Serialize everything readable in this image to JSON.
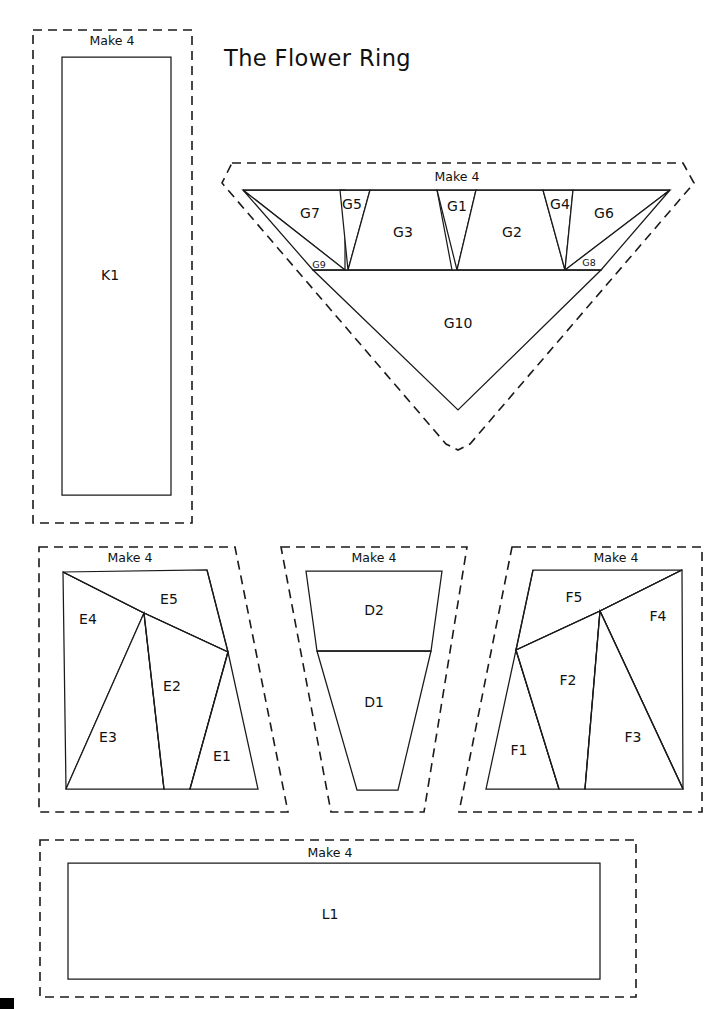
{
  "document": {
    "title": "The Flower Ring",
    "title_position": {
      "x": 224,
      "y": 66
    },
    "page_width": 726,
    "page_height": 1009,
    "background_color": "#ffffff",
    "line_color": "#1a1a1a",
    "corner_mark": {
      "x": 0,
      "y": 998,
      "width": 14,
      "height": 11
    }
  },
  "blocks": [
    {
      "id": "block-k",
      "name": "K",
      "make_label": "Make 4",
      "make_label_position": {
        "x": 112,
        "y": 45
      },
      "cut_outline": "M 33 30 L 192 30 L 192 523 L 33 523 Z",
      "pieces": [
        {
          "id": "K1",
          "label": "K1",
          "label_position": {
            "x": 110,
            "y": 276
          },
          "label_size": "normal",
          "shape": "M 62 57 L 171 57 L 171 495 L 62 495 Z"
        }
      ],
      "seams": []
    },
    {
      "id": "block-g",
      "name": "G",
      "make_label": "Make 4",
      "make_label_position": {
        "x": 457,
        "y": 181
      },
      "cut_outline": "M 232 163 L 683 163 L 694 183 L 470 444 L 458 450 L 446 444 L 222 183 Z",
      "pieces": [
        {
          "id": "G7",
          "label": "G7",
          "label_position": {
            "x": 310,
            "y": 214
          },
          "label_size": "normal",
          "shape": "M 243 190 L 345 190 L 345 270 Z"
        },
        {
          "id": "G9",
          "label": "G9",
          "label_position": {
            "x": 319,
            "y": 265
          },
          "label_size": "small",
          "shape": "M 243 190 L 345 270 L 313 270 Z"
        },
        {
          "id": "G5",
          "label": "G5",
          "label_position": {
            "x": 352,
            "y": 205
          },
          "label_size": "normal",
          "shape": "M 340 190 L 370 190 L 348 270 Z"
        },
        {
          "id": "G3",
          "label": "G3",
          "label_position": {
            "x": 403,
            "y": 233
          },
          "label_size": "normal",
          "shape": "M 370 190 L 437 190 L 452 270 L 348 270 Z"
        },
        {
          "id": "G1",
          "label": "G1",
          "label_position": {
            "x": 457,
            "y": 207
          },
          "label_size": "normal",
          "shape": "M 437 190 L 476 190 L 457 270 Z"
        },
        {
          "id": "G2",
          "label": "G2",
          "label_position": {
            "x": 512,
            "y": 233
          },
          "label_size": "normal",
          "shape": "M 476 190 L 543 190 L 565 270 L 457 270 Z"
        },
        {
          "id": "G4",
          "label": "G4",
          "label_position": {
            "x": 560,
            "y": 205
          },
          "label_size": "normal",
          "shape": "M 543 190 L 573 190 L 565 270 Z"
        },
        {
          "id": "G6",
          "label": "G6",
          "label_position": {
            "x": 604,
            "y": 214
          },
          "label_size": "normal",
          "shape": "M 573 190 L 670 190 L 565 270 Z"
        },
        {
          "id": "G8",
          "label": "G8",
          "label_position": {
            "x": 589,
            "y": 263
          },
          "label_size": "small",
          "shape": "M 670 190 L 601 270 L 565 270 Z"
        },
        {
          "id": "G10",
          "label": "G10",
          "label_position": {
            "x": 458,
            "y": 324
          },
          "label_size": "normal",
          "shape": "M 313 270 L 601 270 L 458 410 Z"
        }
      ],
      "seams": [
        "M 243 190 L 670 190",
        "M 313 270 L 601 270"
      ]
    },
    {
      "id": "block-e",
      "name": "E",
      "make_label": "Make 4",
      "make_label_position": {
        "x": 130,
        "y": 562
      },
      "cut_outline": "M 39 547 L 235 547 L 288 812 L 39 812 Z",
      "pieces": [
        {
          "id": "E4",
          "label": "E4",
          "label_position": {
            "x": 88,
            "y": 620
          },
          "label_size": "normal",
          "shape": "M 63 572 L 144 613 L 66 789 Z"
        },
        {
          "id": "E5",
          "label": "E5",
          "label_position": {
            "x": 169,
            "y": 600
          },
          "label_size": "normal",
          "shape": "M 63 572 L 207 570 L 228 652 L 144 613 Z"
        },
        {
          "id": "E3",
          "label": "E3",
          "label_position": {
            "x": 108,
            "y": 738
          },
          "label_size": "normal",
          "shape": "M 144 613 L 164 789 L 66 789 Z"
        },
        {
          "id": "E2",
          "label": "E2",
          "label_position": {
            "x": 172,
            "y": 687
          },
          "label_size": "normal",
          "shape": "M 144 613 L 228 652 L 190 789 L 164 789 Z"
        },
        {
          "id": "E1",
          "label": "E1",
          "label_position": {
            "x": 222,
            "y": 757
          },
          "label_size": "normal",
          "shape": "M 228 652 L 258 789 L 190 789 Z"
        }
      ],
      "seams": [
        "M 63 572 L 144 613",
        "M 144 613 L 228 652",
        "M 144 613 L 164 789",
        "M 228 652 L 190 789",
        "M 207 570 L 228 652"
      ]
    },
    {
      "id": "block-d",
      "name": "D",
      "make_label": "Make 4",
      "make_label_position": {
        "x": 374,
        "y": 562
      },
      "cut_outline": "M 281 547 L 467 547 L 424 812 L 331 812 Z",
      "pieces": [
        {
          "id": "D2",
          "label": "D2",
          "label_position": {
            "x": 374,
            "y": 611
          },
          "label_size": "normal",
          "shape": "M 306 571 L 442 571 L 431 651 L 317 651 Z"
        },
        {
          "id": "D1",
          "label": "D1",
          "label_position": {
            "x": 374,
            "y": 703
          },
          "label_size": "normal",
          "shape": "M 317 651 L 431 651 L 398 790 L 357 790 Z"
        }
      ],
      "seams": [
        "M 317 651 L 431 651"
      ]
    },
    {
      "id": "block-f",
      "name": "F",
      "make_label": "Make 4",
      "make_label_position": {
        "x": 616,
        "y": 562
      },
      "cut_outline": "M 512 547 L 702 547 L 702 812 L 459 812 Z",
      "pieces": [
        {
          "id": "F5",
          "label": "F5",
          "label_position": {
            "x": 574,
            "y": 598
          },
          "label_size": "normal",
          "shape": "M 533 570 L 682 570 L 600 611 L 516 650 Z"
        },
        {
          "id": "F4",
          "label": "F4",
          "label_position": {
            "x": 658,
            "y": 617
          },
          "label_size": "normal",
          "shape": "M 682 570 L 683 789 L 600 611 Z"
        },
        {
          "id": "F1",
          "label": "F1",
          "label_position": {
            "x": 519,
            "y": 751
          },
          "label_size": "normal",
          "shape": "M 516 650 L 559 789 L 486 789 Z"
        },
        {
          "id": "F2",
          "label": "F2",
          "label_position": {
            "x": 568,
            "y": 681
          },
          "label_size": "normal",
          "shape": "M 516 650 L 600 611 L 585 789 L 559 789 Z"
        },
        {
          "id": "F3",
          "label": "F3",
          "label_position": {
            "x": 633,
            "y": 738
          },
          "label_size": "normal",
          "shape": "M 600 611 L 683 789 L 585 789 Z"
        }
      ],
      "seams": [
        "M 533 570 L 516 650",
        "M 516 650 L 600 611",
        "M 600 611 L 682 570",
        "M 516 650 L 559 789",
        "M 600 611 L 585 789",
        "M 600 611 L 683 789"
      ]
    },
    {
      "id": "block-l",
      "name": "L",
      "make_label": "Make 4",
      "make_label_position": {
        "x": 330,
        "y": 857
      },
      "cut_outline": "M 40 840 L 636 840 L 636 997 L 40 997 Z",
      "pieces": [
        {
          "id": "L1",
          "label": "L1",
          "label_position": {
            "x": 330,
            "y": 915
          },
          "label_size": "normal",
          "shape": "M 68 863 L 600 863 L 600 979 L 68 979 Z"
        }
      ],
      "seams": []
    }
  ]
}
